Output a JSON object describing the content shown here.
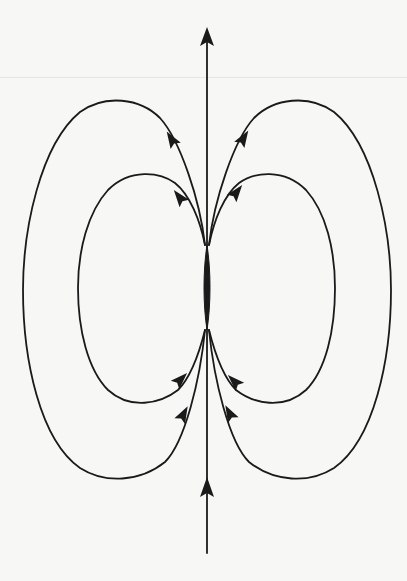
{
  "diagram": {
    "title": "",
    "type": "magnetic-dipole-field-lines",
    "colors": {
      "background": "#f7f7f5",
      "line": "#1a1a1a"
    },
    "axis": {
      "x": 207,
      "y_top": 28,
      "y_bottom": 553,
      "arrows": [
        "up-top",
        "up-bottom"
      ]
    },
    "loops": [
      {
        "name": "outer-left",
        "side": "left",
        "extreme_x": 23,
        "top_y": 100,
        "bottom_y": 478
      },
      {
        "name": "inner-left",
        "side": "left",
        "extreme_x": 78,
        "top_y": 173,
        "bottom_y": 403
      },
      {
        "name": "inner-right",
        "side": "right",
        "extreme_x": 335,
        "top_y": 172,
        "bottom_y": 402
      },
      {
        "name": "outer-right",
        "side": "right",
        "extreme_x": 391,
        "top_y": 101,
        "bottom_y": 478
      }
    ],
    "focal_points": {
      "upper_y": 245,
      "lower_y": 330
    },
    "arrow_direction": "field lines exit upper pole and return into lower pole (all arrows point upward/outward along the top, inward along the bottom)"
  }
}
